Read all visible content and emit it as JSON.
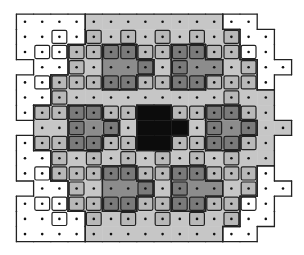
{
  "diagram": {
    "grid": {
      "cols": 16,
      "rows": 15,
      "origin_x": 25,
      "origin_y": 21.7,
      "pitch_x": 17.2,
      "pitch_y": 15.17
    },
    "palette": {
      "W": "#ffffff",
      "L": "#c6c6c6",
      "D": "#8c8c8c",
      "B": "#0c0c0c",
      "outline": "#222222",
      "dot": "#111111",
      "overlap_L": "#b8b8b8",
      "overlap_D": "#7a7a7a"
    },
    "shading_rows": [
      "WWWWLLLLLLLLWW..",
      "WWWWLLLLLLLLLWW.",
      "WWWLLDDLLDDLLWW.",
      ".WWLLDDDLDDDLLWW",
      "WWLLLDDLLDDLLLW.",
      "WWLLLLLLLLLLLLL.",
      "WLLDDLLBBLLDDLL.",
      ".LLDDDLBBBLDDDLL",
      "WLLDDLLBBLLDDLL.",
      "WWLLLLLLLLLLLLL.",
      "WWLLLDDLLDDLLLW.",
      ".WWLLDDDLDDDLLWW",
      "WWWLLDDLLDDLLWW.",
      "WWWWLLLLLLLLLWW.",
      "WWWWLLLLLLLLWW.."
    ],
    "overlap_rows": [
      "................",
      "..x.x.x.x.x.x...",
      ".xxxxxxxxxxxxx..",
      "...x...x.x...x..",
      ".xxxxxxxxxxxxx..",
      "..x.........x...",
      ".xxxxxx..xxxxx..",
      "...x.x.....x.x..",
      ".xxxxxx..xxxxx..",
      "..x.x.x.x.x.x...",
      ".xxxxxxxxxxxxx..",
      "...x...x.x...x..",
      ".xxxxxxxxxxxxx..",
      "..x.x.x.x.x.x...",
      "................"
    ],
    "pieces": {
      "shape_description": "2x3 block with one-cell tab on the right of the middle row",
      "black_piece": {
        "cols": [
          7,
          8
        ],
        "rows": [
          6,
          8
        ],
        "tab": {
          "col": 9,
          "row": 7
        }
      }
    }
  }
}
